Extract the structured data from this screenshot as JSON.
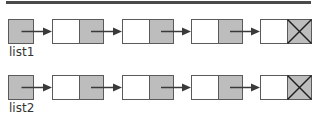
{
  "colors": {
    "rule": "#4a4a4a",
    "box_stroke": "#5a5a5a",
    "pointer_fill": "#bdbdbd",
    "data_fill": "#ffffff",
    "arrow": "#3a3a3a",
    "null_x": "#1e1e1e"
  },
  "lists": [
    {
      "label": "list1",
      "head": {
        "type": "pointer"
      },
      "nodes": [
        {
          "data": "",
          "next": "pointer"
        },
        {
          "data": "",
          "next": "pointer"
        },
        {
          "data": "",
          "next": "pointer"
        },
        {
          "data": "",
          "next": "null"
        }
      ]
    },
    {
      "label": "list2",
      "head": {
        "type": "pointer"
      },
      "nodes": [
        {
          "data": "",
          "next": "pointer"
        },
        {
          "data": "",
          "next": "pointer"
        },
        {
          "data": "",
          "next": "pointer"
        },
        {
          "data": "",
          "next": "null"
        }
      ]
    }
  ]
}
